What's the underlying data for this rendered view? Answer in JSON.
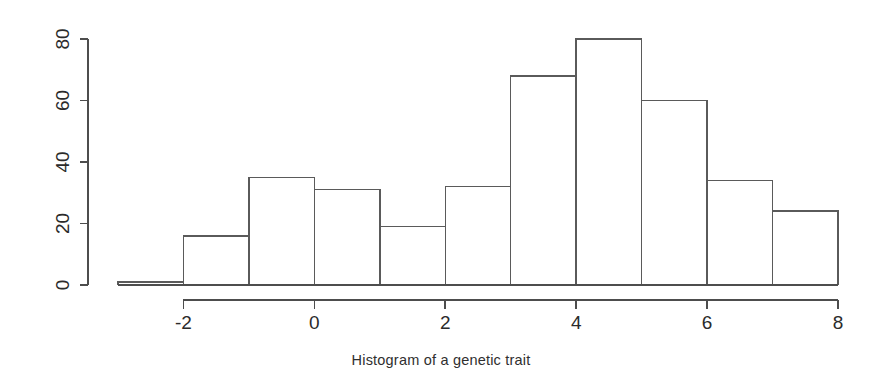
{
  "caption": "Histogram of a genetic trait",
  "colors": {
    "background": "#ffffff",
    "axis": "#4d4d4d",
    "bar_stroke": "#5a5a5a",
    "text": "#2b2b2b"
  },
  "chart_data": {
    "type": "bar",
    "title": "Histogram of a genetic trait",
    "xlabel": "",
    "ylabel": "",
    "bin_width": 1,
    "bin_edges": [
      -3,
      -2,
      -1,
      0,
      1,
      2,
      3,
      4,
      5,
      6,
      7,
      8
    ],
    "categories": [
      "-3 to -2",
      "-2 to -1",
      "-1 to 0",
      "0 to 1",
      "1 to 2",
      "2 to 3",
      "3 to 4",
      "4 to 5",
      "5 to 6",
      "6 to 7",
      "7 to 8"
    ],
    "values": [
      1,
      16,
      35,
      31,
      19,
      32,
      68,
      80,
      60,
      34,
      24
    ],
    "xlim": [
      -3,
      8
    ],
    "ylim": [
      0,
      80
    ],
    "xticks": [
      -2,
      0,
      2,
      4,
      6,
      8
    ],
    "xtick_labels": [
      "-2",
      "0",
      "2",
      "4",
      "6",
      "8"
    ],
    "yticks": [
      0,
      20,
      40,
      60,
      80
    ],
    "ytick_labels": [
      "0",
      "20",
      "40",
      "60",
      "80"
    ],
    "grid": false,
    "legend": false,
    "ytick_label_rotation": -90
  }
}
